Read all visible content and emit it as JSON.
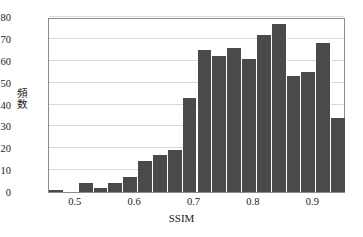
{
  "chart_data": {
    "type": "bar",
    "title": "",
    "xlabel": "SSIM",
    "ylabel": "頻数",
    "xlim": [
      0.455,
      0.955
    ],
    "ylim": [
      0,
      80
    ],
    "grid": true,
    "legend": "none",
    "bar_color": "#4a4a4a",
    "bin_width": 0.025,
    "bin_starts": [
      0.455,
      0.48,
      0.505,
      0.53,
      0.555,
      0.58,
      0.605,
      0.63,
      0.655,
      0.68,
      0.705,
      0.73,
      0.755,
      0.78,
      0.805,
      0.83,
      0.855,
      0.88,
      0.905,
      0.93
    ],
    "categories": [
      "0.455-0.48",
      "0.48-0.505",
      "0.505-0.53",
      "0.53-0.555",
      "0.555-0.58",
      "0.58-0.605",
      "0.605-0.63",
      "0.63-0.655",
      "0.655-0.68",
      "0.68-0.705",
      "0.705-0.73",
      "0.73-0.755",
      "0.755-0.78",
      "0.78-0.805",
      "0.805-0.83",
      "0.83-0.855",
      "0.855-0.88",
      "0.88-0.905",
      "0.905-0.93",
      "0.93-0.955"
    ],
    "values": [
      1,
      0,
      4,
      2,
      4,
      7,
      14,
      17,
      19,
      43,
      65,
      62,
      66,
      61,
      72,
      77,
      53,
      55,
      68,
      34
    ],
    "xticks": [
      {
        "value": 0.5,
        "label": "0.5"
      },
      {
        "value": 0.6,
        "label": "0.6"
      },
      {
        "value": 0.7,
        "label": "0.7"
      },
      {
        "value": 0.8,
        "label": "0.8"
      },
      {
        "value": 0.9,
        "label": "0.9"
      }
    ],
    "yticks": [
      {
        "value": 0,
        "label": "0"
      },
      {
        "value": 10,
        "label": "10"
      },
      {
        "value": 20,
        "label": "20"
      },
      {
        "value": 30,
        "label": "30"
      },
      {
        "value": 40,
        "label": "40"
      },
      {
        "value": 50,
        "label": "50"
      },
      {
        "value": 60,
        "label": "60"
      },
      {
        "value": 70,
        "label": "70"
      },
      {
        "value": 80,
        "label": "80"
      }
    ]
  }
}
